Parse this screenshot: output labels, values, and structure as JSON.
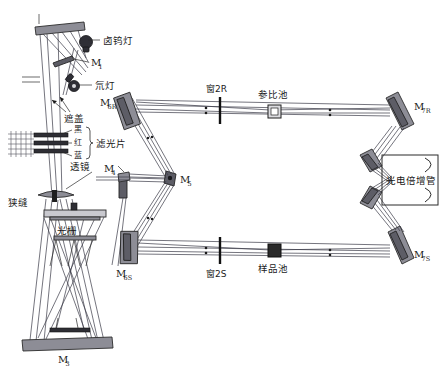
{
  "diagram": {
    "type": "optical-path-schematic",
    "width": 442,
    "height": 368,
    "background_color": "#ffffff",
    "line_color": "#2b2b2b",
    "mirror_fill": "#8d8d96"
  },
  "labels": {
    "m2": {
      "base": "M",
      "sub": "2"
    },
    "m1": {
      "base": "M",
      "sub": "1"
    },
    "m3": {
      "base": "M",
      "sub": "3"
    },
    "m4": {
      "base": "M",
      "sub": "4"
    },
    "m5": {
      "base": "M",
      "sub": "5"
    },
    "m6r": {
      "base": "M",
      "sub": "6R"
    },
    "m6s": {
      "base": "M",
      "sub": "6S"
    },
    "m7r": {
      "base": "M",
      "sub": "7R"
    },
    "m7s": {
      "base": "M",
      "sub": "7S"
    },
    "tungsten_lamp": "卤钨灯",
    "deuterium_lamp": "氘灯",
    "shutter": "遮盖",
    "filter": "滤光片",
    "filter_black": "黑",
    "filter_red": "红",
    "filter_blue": "蓝",
    "lens": "透镜",
    "slit": "狭缝",
    "grating": "光栅",
    "window_2r": "窗2R",
    "window_2s": "窗2S",
    "reference_cell": "参比池",
    "sample_cell": "样品池",
    "photomultiplier": "光电倍增管"
  }
}
